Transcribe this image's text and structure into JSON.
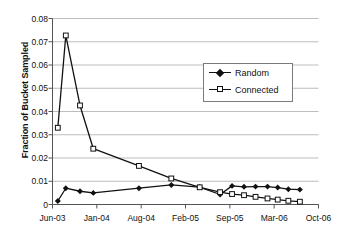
{
  "chart_data": {
    "type": "line",
    "title": "",
    "xlabel": "",
    "ylabel": "Fraction of Bucket Sampled",
    "ylim": [
      0,
      0.08
    ],
    "ytick_labels": [
      "0.08",
      "0.07",
      "0.06",
      "0.05",
      "0.04",
      "0.03",
      "0.02",
      "0.01",
      "0"
    ],
    "ytick_values": [
      0.08,
      0.07,
      0.06,
      0.05,
      0.04,
      0.03,
      0.02,
      0.01,
      0
    ],
    "xtick_labels": [
      "Jun-03",
      "Jan-04",
      "Aug-04",
      "Feb-05",
      "Sep-05",
      "Mar-06",
      "Oct-06"
    ],
    "xtick_values": [
      0,
      1,
      2,
      3,
      4,
      5,
      6
    ],
    "xlim": [
      0,
      6
    ],
    "grid": "horizontal",
    "legend_position": "upper-right-inside",
    "series": [
      {
        "name": "Random",
        "marker": "filled-diamond",
        "color": "#111111",
        "x": [
          0.12,
          0.3,
          0.62,
          0.92,
          1.95,
          2.68,
          3.32,
          3.78,
          4.05,
          4.32,
          4.58,
          4.85,
          5.08,
          5.32,
          5.58
        ],
        "values": [
          0.0015,
          0.007,
          0.0057,
          0.005,
          0.007,
          0.0084,
          0.0075,
          0.0043,
          0.008,
          0.0076,
          0.0077,
          0.0077,
          0.0073,
          0.0066,
          0.0064
        ]
      },
      {
        "name": "Connected",
        "marker": "open-square",
        "color": "#111111",
        "x": [
          0.12,
          0.3,
          0.62,
          0.92,
          1.95,
          2.68,
          3.32,
          3.78,
          4.05,
          4.32,
          4.58,
          4.85,
          5.08,
          5.32,
          5.58
        ],
        "values": [
          0.033,
          0.0727,
          0.0426,
          0.024,
          0.0166,
          0.0112,
          0.0074,
          0.0053,
          0.0045,
          0.004,
          0.0033,
          0.0026,
          0.0021,
          0.0016,
          0.0012
        ]
      }
    ]
  },
  "legend": {
    "items": [
      {
        "label": "Random",
        "marker": "filled-diamond"
      },
      {
        "label": "Connected",
        "marker": "open-square"
      }
    ]
  }
}
